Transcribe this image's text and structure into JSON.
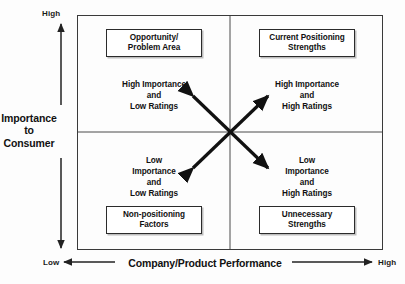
{
  "diagram": {
    "type": "2x2-matrix",
    "y_axis": {
      "title": "Importance\nto\nConsumer",
      "high_label": "High",
      "low_label": "Low"
    },
    "x_axis": {
      "title": "Company/Product Performance",
      "low_label": "Low",
      "high_label": "High"
    },
    "quadrants": {
      "top_left": {
        "callout": "Opportunity/\nProblem Area",
        "description": "High Importance\nand\nLow Ratings"
      },
      "top_right": {
        "callout": "Current Positioning\nStrengths",
        "description": "High Importance\nand\nHigh Ratings"
      },
      "bottom_left": {
        "callout": "Non-positioning\nFactors",
        "description": "Low\nImportance\nand\nLow Ratings"
      },
      "bottom_right": {
        "callout": "Unnecessary\nStrengths",
        "description": "Low\nImportance\nand\nHigh Ratings"
      }
    },
    "colors": {
      "line": "#2b2b2b",
      "frame": "#3a3a3a",
      "text": "#111111",
      "background": "#fdfdfd"
    }
  }
}
